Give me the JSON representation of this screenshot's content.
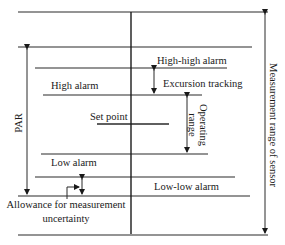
{
  "diagram": {
    "labels": {
      "high_high_alarm": "High-high alarm",
      "excursion_tracking": "Excursion tracking",
      "high_alarm": "High alarm",
      "set_point": "Set point",
      "operating_range_line1": "Operating",
      "operating_range_line2": "range",
      "low_alarm": "Low alarm",
      "low_low_alarm": "Low-low alarm",
      "allowance_line1": "Allowance for measurement",
      "allowance_line2": "uncertainty",
      "par": "PAR",
      "measurement_range": "Measurement range of sensor"
    },
    "colors": {
      "line": "#2a2a2a",
      "text": "#1a1a1a",
      "background": "#ffffff"
    }
  }
}
